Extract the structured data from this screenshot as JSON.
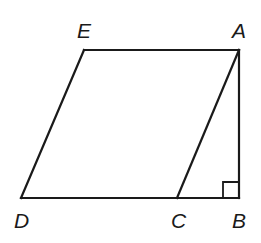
{
  "diagram": {
    "type": "geometry",
    "points": {
      "A": {
        "x": 239,
        "y": 50,
        "label": "A"
      },
      "B": {
        "x": 239,
        "y": 198,
        "label": "B"
      },
      "C": {
        "x": 177,
        "y": 198,
        "label": "C"
      },
      "D": {
        "x": 21,
        "y": 198,
        "label": "D"
      },
      "E": {
        "x": 84,
        "y": 50,
        "label": "E"
      }
    },
    "segments": [
      "EA",
      "AB",
      "DB",
      "DE",
      "AC"
    ],
    "right_angle_marker": "B",
    "stroke_color": "#1a1a1a"
  },
  "labels": {
    "E": "E",
    "A": "A",
    "D": "D",
    "C": "C",
    "B": "B"
  }
}
